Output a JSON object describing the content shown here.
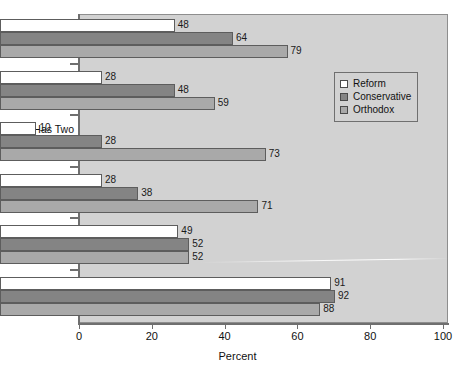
{
  "chart_data": {
    "type": "bar",
    "orientation": "horizontal",
    "title": "",
    "xlabel": "Percent",
    "ylabel": "",
    "xlim": [
      0,
      100
    ],
    "xticks": [
      0,
      20,
      40,
      60,
      80,
      100
    ],
    "grid": false,
    "legend_position": "upper right",
    "categories": [
      "Most\nfriends are\nJewish",
      "Has been\nto Israel",
      "Has Two\nSets of\nDishes",
      "Lights\nCandles on\nFriday Night",
      "Belongs to\na Jewish\norganization",
      "Has a\nPassover\nSeder"
    ],
    "series": [
      {
        "name": "Reform",
        "color": "#ffffff",
        "values": [
          48,
          28,
          10,
          28,
          49,
          91
        ]
      },
      {
        "name": "Conservative",
        "color": "#848484",
        "values": [
          64,
          48,
          28,
          38,
          52,
          92
        ]
      },
      {
        "name": "Orthodox",
        "color": "#a9a9a9",
        "values": [
          79,
          59,
          73,
          71,
          52,
          88
        ]
      }
    ]
  },
  "colors": {
    "plot_background": "#d2d2d2",
    "page_background": "#ffffff",
    "axis": "#6f6f6f",
    "bar_outline": "#5d5d5d",
    "text": "#111111"
  }
}
